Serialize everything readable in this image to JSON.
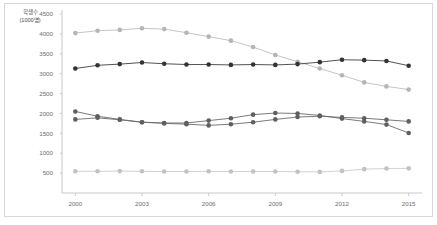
{
  "chart_data": {
    "type": "line",
    "title": "",
    "xlabel": "",
    "ylabel": "학생수\n(1000명)",
    "ylabel_lines": [
      "학생수",
      "(1000명)"
    ],
    "x": [
      2000,
      2001,
      2002,
      2003,
      2004,
      2005,
      2006,
      2007,
      2008,
      2009,
      2010,
      2011,
      2012,
      2013,
      2014,
      2015
    ],
    "xlim": [
      1999.4,
      2015.6
    ],
    "ylim": [
      0,
      4500
    ],
    "xticks": [
      2000,
      2003,
      2006,
      2009,
      2012,
      2015
    ],
    "xtick_labels": [
      "2000",
      "2003",
      "2006",
      "2009",
      "2012",
      "2015"
    ],
    "yticks": [
      500,
      1000,
      1500,
      2000,
      2500,
      3000,
      3500,
      4000,
      4500
    ],
    "ytick_labels": [
      "500",
      "1000",
      "1500",
      "2000",
      "2500",
      "3000",
      "3500",
      "4000",
      "4500"
    ],
    "grid": false,
    "legend": "none",
    "marker": "circle",
    "series": [
      {
        "name": "series-1-light-upper",
        "color": "#bdbdbd",
        "marker_color": "#b5b5b5",
        "values": [
          4020,
          4080,
          4100,
          4140,
          4120,
          4030,
          3930,
          3830,
          3670,
          3470,
          3300,
          3130,
          2960,
          2780,
          2680,
          2600
        ]
      },
      {
        "name": "series-2-dark",
        "color": "#3f3f3f",
        "marker_color": "#333333",
        "values": [
          3130,
          3210,
          3240,
          3280,
          3250,
          3230,
          3230,
          3220,
          3230,
          3220,
          3240,
          3290,
          3350,
          3340,
          3320,
          3200
        ]
      },
      {
        "name": "series-3-mid-a",
        "color": "#6b6b6b",
        "marker_color": "#5f5f5f",
        "values": [
          2050,
          1930,
          1850,
          1780,
          1760,
          1760,
          1820,
          1880,
          1970,
          2010,
          2000,
          1950,
          1870,
          1800,
          1720,
          1510
        ]
      },
      {
        "name": "series-4-mid-b",
        "color": "#6b6b6b",
        "marker_color": "#5f5f5f",
        "values": [
          1850,
          1890,
          1840,
          1780,
          1750,
          1730,
          1700,
          1730,
          1780,
          1850,
          1910,
          1930,
          1900,
          1880,
          1840,
          1800
        ]
      },
      {
        "name": "series-5-light-lower",
        "color": "#cccccc",
        "marker_color": "#c2c2c2",
        "values": [
          545,
          545,
          550,
          545,
          540,
          540,
          545,
          540,
          540,
          540,
          535,
          530,
          555,
          600,
          615,
          620
        ]
      }
    ]
  },
  "axis": {
    "y_title_line1": "학생수",
    "y_title_line2": "(1000명)"
  }
}
